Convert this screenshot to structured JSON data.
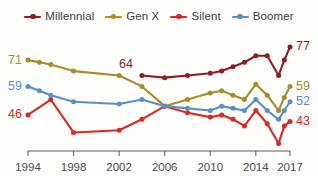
{
  "chart_data": {
    "type": "line",
    "title": "",
    "subtitle": "",
    "xlabel": "",
    "ylabel": "",
    "xlim": [
      1994,
      2017
    ],
    "ylim": [
      30,
      82
    ],
    "grid": false,
    "legend_position": "top-center",
    "x_tick_labels": [
      "1994",
      "1998",
      "2002",
      "2006",
      "2010",
      "2014",
      "2017"
    ],
    "x_ticks": [
      1994,
      1998,
      2002,
      2006,
      2010,
      2014,
      2017
    ],
    "legend": [
      "Millennial",
      "Gen X",
      "Silent",
      "Boomer"
    ],
    "colors": {
      "millennial": "#8c1d22",
      "genx": "#a98a25",
      "silent": "#d62b22",
      "boomer": "#5b8fc4",
      "axis": "#5a5a5a",
      "tick_text": "#4a4a4a",
      "legend_text": "#3b3b3b",
      "background": "#fdfdfc"
    },
    "series": [
      {
        "name": "Millennial",
        "color_key": "millennial",
        "start_label": "64",
        "end_label": "77",
        "start_label_value": 64,
        "end_label_value": 77,
        "points": [
          {
            "x": 2004,
            "y": 64
          },
          {
            "x": 2006,
            "y": 63
          },
          {
            "x": 2008,
            "y": 64
          },
          {
            "x": 2010,
            "y": 65
          },
          {
            "x": 2011,
            "y": 66
          },
          {
            "x": 2012,
            "y": 68
          },
          {
            "x": 2013,
            "y": 70
          },
          {
            "x": 2014,
            "y": 73
          },
          {
            "x": 2015,
            "y": 73
          },
          {
            "x": 2016,
            "y": 64
          },
          {
            "x": 2016.5,
            "y": 71
          },
          {
            "x": 2017,
            "y": 77
          }
        ]
      },
      {
        "name": "Gen X",
        "color_key": "genx",
        "start_label": "71",
        "end_label": "59",
        "start_label_value": 71,
        "end_label_value": 59,
        "points": [
          {
            "x": 1994,
            "y": 71
          },
          {
            "x": 1995,
            "y": 70
          },
          {
            "x": 1996,
            "y": 69
          },
          {
            "x": 1998,
            "y": 66
          },
          {
            "x": 2002,
            "y": 64
          },
          {
            "x": 2004,
            "y": 59
          },
          {
            "x": 2006,
            "y": 50
          },
          {
            "x": 2008,
            "y": 53
          },
          {
            "x": 2010,
            "y": 56
          },
          {
            "x": 2011,
            "y": 57
          },
          {
            "x": 2012,
            "y": 55
          },
          {
            "x": 2013,
            "y": 53
          },
          {
            "x": 2014,
            "y": 60
          },
          {
            "x": 2015,
            "y": 55
          },
          {
            "x": 2016,
            "y": 48
          },
          {
            "x": 2016.5,
            "y": 54
          },
          {
            "x": 2017,
            "y": 59
          }
        ]
      },
      {
        "name": "Silent",
        "color_key": "silent",
        "start_label": "46",
        "end_label": "43",
        "start_label_value": 46,
        "end_label_value": 43,
        "points": [
          {
            "x": 1994,
            "y": 46
          },
          {
            "x": 1996,
            "y": 53
          },
          {
            "x": 1998,
            "y": 38
          },
          {
            "x": 2002,
            "y": 39
          },
          {
            "x": 2004,
            "y": 44
          },
          {
            "x": 2006,
            "y": 50
          },
          {
            "x": 2008,
            "y": 47
          },
          {
            "x": 2010,
            "y": 45
          },
          {
            "x": 2011,
            "y": 46
          },
          {
            "x": 2012,
            "y": 44
          },
          {
            "x": 2013,
            "y": 41
          },
          {
            "x": 2014,
            "y": 48
          },
          {
            "x": 2015,
            "y": 42
          },
          {
            "x": 2016,
            "y": 33
          },
          {
            "x": 2016.5,
            "y": 41
          },
          {
            "x": 2017,
            "y": 43
          }
        ]
      },
      {
        "name": "Boomer",
        "color_key": "boomer",
        "start_label": "59",
        "end_label": "52",
        "start_label_value": 59,
        "end_label_value": 52,
        "points": [
          {
            "x": 1994,
            "y": 59
          },
          {
            "x": 1995,
            "y": 57
          },
          {
            "x": 1996,
            "y": 55
          },
          {
            "x": 1998,
            "y": 52
          },
          {
            "x": 2002,
            "y": 51
          },
          {
            "x": 2004,
            "y": 53
          },
          {
            "x": 2006,
            "y": 50
          },
          {
            "x": 2008,
            "y": 49
          },
          {
            "x": 2010,
            "y": 48
          },
          {
            "x": 2011,
            "y": 50
          },
          {
            "x": 2012,
            "y": 49
          },
          {
            "x": 2013,
            "y": 48
          },
          {
            "x": 2014,
            "y": 53
          },
          {
            "x": 2015,
            "y": 48
          },
          {
            "x": 2016,
            "y": 44
          },
          {
            "x": 2016.5,
            "y": 48
          },
          {
            "x": 2017,
            "y": 52
          }
        ]
      }
    ]
  }
}
